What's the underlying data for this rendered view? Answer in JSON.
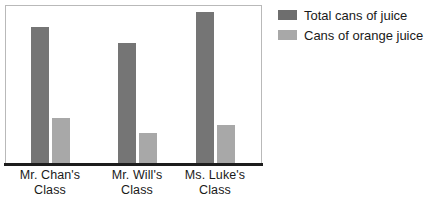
{
  "chart_data": {
    "type": "bar",
    "title": "",
    "xlabel": "",
    "ylabel": "",
    "grid": false,
    "legend_position": "right",
    "ylim": [
      0,
      160
    ],
    "categories": [
      "Mr. Chan's Class",
      "Mr. Will's Class",
      "Ms. Luke's Class"
    ],
    "category_lines": [
      {
        "line1": "Mr. Chan's",
        "line2": "Class"
      },
      {
        "line1": "Mr. Will's",
        "line2": "Class"
      },
      {
        "line1": "Ms. Luke's",
        "line2": "Class"
      }
    ],
    "series": [
      {
        "name": "Total cans of juice",
        "color": "#757575",
        "values": [
          138,
          122,
          153
        ]
      },
      {
        "name": "Cans of orange juice",
        "color": "#a8a8a8",
        "values": [
          46,
          31,
          39
        ]
      }
    ]
  },
  "legend": {
    "items": [
      {
        "label": "Total cans of juice",
        "swatch_color": "#6e6e6e"
      },
      {
        "label": "Cans of orange juice",
        "swatch_color": "#a8a8a8"
      }
    ]
  },
  "axis": {
    "baseline_color": "#1d1d1d",
    "frame_color": "#b9b9b9"
  }
}
